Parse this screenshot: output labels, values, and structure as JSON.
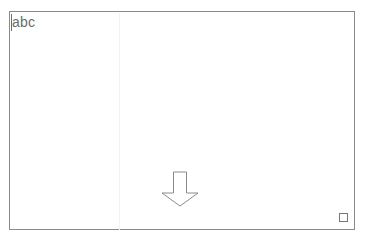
{
  "canvas": {
    "label": "drawing-canvas",
    "background_color": "#ffffff",
    "border_color": "#8a8a8a",
    "border_width_px": 1,
    "bounds": {
      "x": 9,
      "y": 11,
      "width": 346,
      "height": 219
    }
  },
  "guide": {
    "name": "vertical-guide-line",
    "color": "#f2f2f2",
    "orientation": "vertical",
    "x": 118
  },
  "text_object": {
    "value": "abc",
    "color": "#6b6b6b",
    "font_size_px": 14,
    "caret_visible": true,
    "caret_color": "#6e6e6e",
    "position": {
      "x": 10,
      "y": 11
    }
  },
  "shape": {
    "name": "down-arrow",
    "type": "block-arrow",
    "direction": "down",
    "stroke_color": "#8a8a8a",
    "fill": "none",
    "stroke_width_px": 1,
    "bounds": {
      "x": 160,
      "y": 170,
      "width": 38,
      "height": 36
    }
  },
  "handle": {
    "name": "resize-handle-bottom-right",
    "border_color": "#777777",
    "fill_color": "#ffffff",
    "size_px": 9,
    "position": {
      "x": 348,
      "y": 224
    }
  }
}
